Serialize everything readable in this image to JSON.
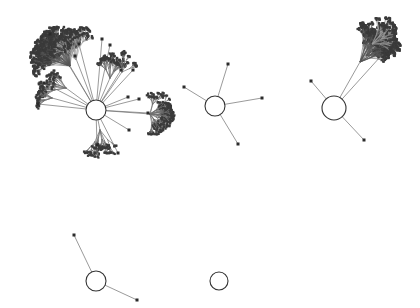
{
  "figure": {
    "title": "",
    "background_color": "#ffffff",
    "width": 420,
    "height": 308
  },
  "style": {
    "edge_color": "#6e6e6e",
    "edge_faint_color": "#9a9a9a",
    "edge_dense_color": "#555555",
    "node_color": "#2b2b2b",
    "hub_stroke_color": "#333333",
    "hub_fill_color": "#ffffff",
    "edge_width": 0.7,
    "leaf_node_size": 3,
    "small_node_size": 2
  },
  "chart_data": {
    "type": "scatter",
    "title": "",
    "xlabel": "",
    "ylabel": "",
    "xlim": [
      0,
      420
    ],
    "ylim": [
      0,
      308
    ],
    "grid": false,
    "legend": "none",
    "components": [
      {
        "id": "component-1",
        "name": "main-hub-component",
        "hub": {
          "cx": 96,
          "cy": 110,
          "r": 10
        },
        "node_count": 28,
        "has_dense_subtree": true
      },
      {
        "id": "component-2",
        "name": "center-hub-component",
        "hub": {
          "cx": 215,
          "cy": 106,
          "r": 10
        },
        "node_count": 5,
        "has_dense_subtree": false
      },
      {
        "id": "component-3",
        "name": "right-hub-component",
        "hub": {
          "cx": 334,
          "cy": 108,
          "r": 12
        },
        "node_count": 3,
        "has_dense_subtree": true
      },
      {
        "id": "component-4",
        "name": "lower-left-hub-component",
        "hub": {
          "cx": 96,
          "cy": 281,
          "r": 10
        },
        "node_count": 2,
        "has_dense_subtree": false
      },
      {
        "id": "component-5",
        "name": "isolated-hub-component",
        "hub": {
          "cx": 219,
          "cy": 281,
          "r": 9
        },
        "node_count": 0,
        "has_dense_subtree": false
      }
    ],
    "hubs": [
      {
        "label": "hub-1",
        "x": 96,
        "y": 110,
        "r": 10
      },
      {
        "label": "hub-2",
        "x": 215,
        "y": 106,
        "r": 10
      },
      {
        "label": "hub-3",
        "x": 334,
        "y": 108,
        "r": 12
      },
      {
        "label": "hub-4",
        "x": 96,
        "y": 281,
        "r": 10
      },
      {
        "label": "hub-5",
        "x": 219,
        "y": 281,
        "r": 9
      }
    ],
    "spokes": [
      {
        "from": "hub-1",
        "to": [
          121,
          70
        ]
      },
      {
        "from": "hub-1",
        "to": [
          133,
          70
        ]
      },
      {
        "from": "hub-1",
        "to": [
          102,
          39
        ]
      },
      {
        "from": "hub-1",
        "to": [
          110,
          45
        ]
      },
      {
        "from": "hub-1",
        "to": [
          79,
          44
        ]
      },
      {
        "from": "hub-1",
        "to": [
          75,
          56
        ]
      },
      {
        "from": "hub-1",
        "to": [
          50,
          34
        ]
      },
      {
        "from": "hub-1",
        "to": [
          44,
          83
        ]
      },
      {
        "from": "hub-1",
        "to": [
          38,
          104
        ]
      },
      {
        "from": "hub-1",
        "to": [
          128,
          97
        ]
      },
      {
        "from": "hub-1",
        "to": [
          139,
          99
        ]
      },
      {
        "from": "hub-1",
        "to": [
          148,
          113
        ]
      },
      {
        "from": "hub-1",
        "to": [
          129,
          130
        ]
      },
      {
        "from": "hub-1",
        "to": [
          118,
          153
        ]
      },
      {
        "from": "hub-1",
        "to": [
          97,
          145
        ]
      },
      {
        "from": "hub-2",
        "to": [
          228,
          64
        ]
      },
      {
        "from": "hub-2",
        "to": [
          184,
          87
        ]
      },
      {
        "from": "hub-2",
        "to": [
          262,
          98
        ]
      },
      {
        "from": "hub-2",
        "to": [
          238,
          144
        ]
      },
      {
        "from": "hub-3",
        "to": [
          311,
          81
        ]
      },
      {
        "from": "hub-3",
        "to": [
          364,
          140
        ]
      },
      {
        "from": "hub-3",
        "to": [
          381,
          56
        ]
      },
      {
        "from": "hub-4",
        "to": [
          74,
          235
        ]
      },
      {
        "from": "hub-4",
        "to": [
          137,
          300
        ]
      }
    ],
    "leaf_nodes": [
      [
        121,
        70
      ],
      [
        133,
        70
      ],
      [
        102,
        39
      ],
      [
        110,
        45
      ],
      [
        79,
        44
      ],
      [
        75,
        56
      ],
      [
        50,
        34
      ],
      [
        44,
        83
      ],
      [
        38,
        104
      ],
      [
        128,
        97
      ],
      [
        139,
        99
      ],
      [
        148,
        113
      ],
      [
        129,
        130
      ],
      [
        118,
        153
      ],
      [
        97,
        145
      ],
      [
        228,
        64
      ],
      [
        184,
        87
      ],
      [
        262,
        98
      ],
      [
        238,
        144
      ],
      [
        311,
        81
      ],
      [
        364,
        140
      ],
      [
        74,
        235
      ],
      [
        137,
        300
      ]
    ],
    "dense_cluster_regions": [
      {
        "name": "upper-left-tangle",
        "x": 8,
        "y": 12,
        "width": 62,
        "height": 58,
        "node_estimate": 120
      },
      {
        "name": "left-midfan",
        "x": 28,
        "y": 72,
        "width": 42,
        "height": 26,
        "node_estimate": 18
      },
      {
        "name": "mid-right-burst",
        "x": 132,
        "y": 98,
        "width": 54,
        "height": 42,
        "node_estimate": 40
      },
      {
        "name": "lower-stem",
        "x": 82,
        "y": 128,
        "width": 34,
        "height": 52,
        "node_estimate": 14
      },
      {
        "name": "upper-right-feather",
        "x": 352,
        "y": 6,
        "width": 64,
        "height": 66,
        "node_estimate": 110
      }
    ]
  }
}
